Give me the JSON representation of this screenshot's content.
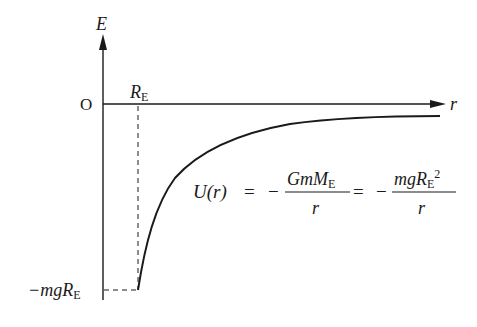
{
  "diagram": {
    "type": "potential-energy-graph",
    "y_axis_label": "E",
    "x_axis_label": "r",
    "origin_label": "O",
    "x_marker": {
      "symbol": "R",
      "subscript": "E"
    },
    "y_marker": {
      "prefix": "−mg",
      "symbol": "R",
      "subscript": "E"
    },
    "equation": {
      "lhs": "U(r)",
      "eq1": "=",
      "neg1": "−",
      "frac1_num": "GmM",
      "frac1_num_sub": "E",
      "frac1_den": "r",
      "eq2": "=",
      "neg2": "−",
      "frac2_num": "mgR",
      "frac2_num_sub": "E",
      "frac2_num_sup": "2",
      "frac2_den": "r"
    },
    "colors": {
      "ink": "#1a1a1a",
      "background": "#ffffff"
    }
  }
}
